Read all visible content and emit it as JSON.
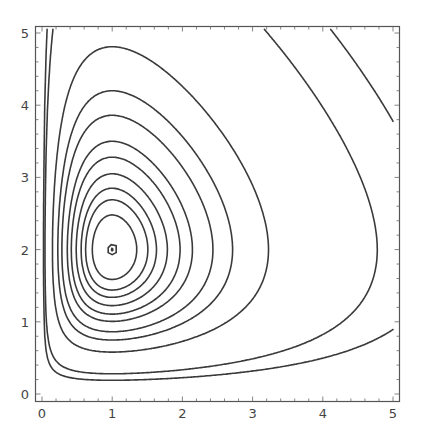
{
  "chart_data": {
    "type": "contour",
    "title": "",
    "xlabel": "",
    "ylabel": "",
    "function": "H(x,y) = x - ln(x) + y - 2 ln(y)",
    "critical_point": {
      "x": 1,
      "y": 2
    },
    "xlim": [
      -0.1,
      5.1
    ],
    "ylim": [
      -0.1,
      5.1
    ],
    "x_ticks": [
      "0",
      "1",
      "2",
      "3",
      "4",
      "5"
    ],
    "y_ticks": [
      "0",
      "1",
      "2",
      "3",
      "4",
      "5"
    ],
    "grid": false,
    "legend": "none",
    "contour_levels": [
      1.6187,
      1.6684,
      1.7331,
      1.8471,
      2.0084,
      2.0957,
      2.2277,
      2.3768,
      2.5281,
      2.3298,
      2.6684,
      3.826,
      4.51
    ],
    "contour_tops_at_x1": [
      2.02,
      2.48,
      2.69,
      2.85,
      3.05,
      3.28,
      3.5,
      3.86,
      4.2,
      4.81
    ],
    "line_color": "#3a3a3a",
    "frame_color": "#555555"
  }
}
